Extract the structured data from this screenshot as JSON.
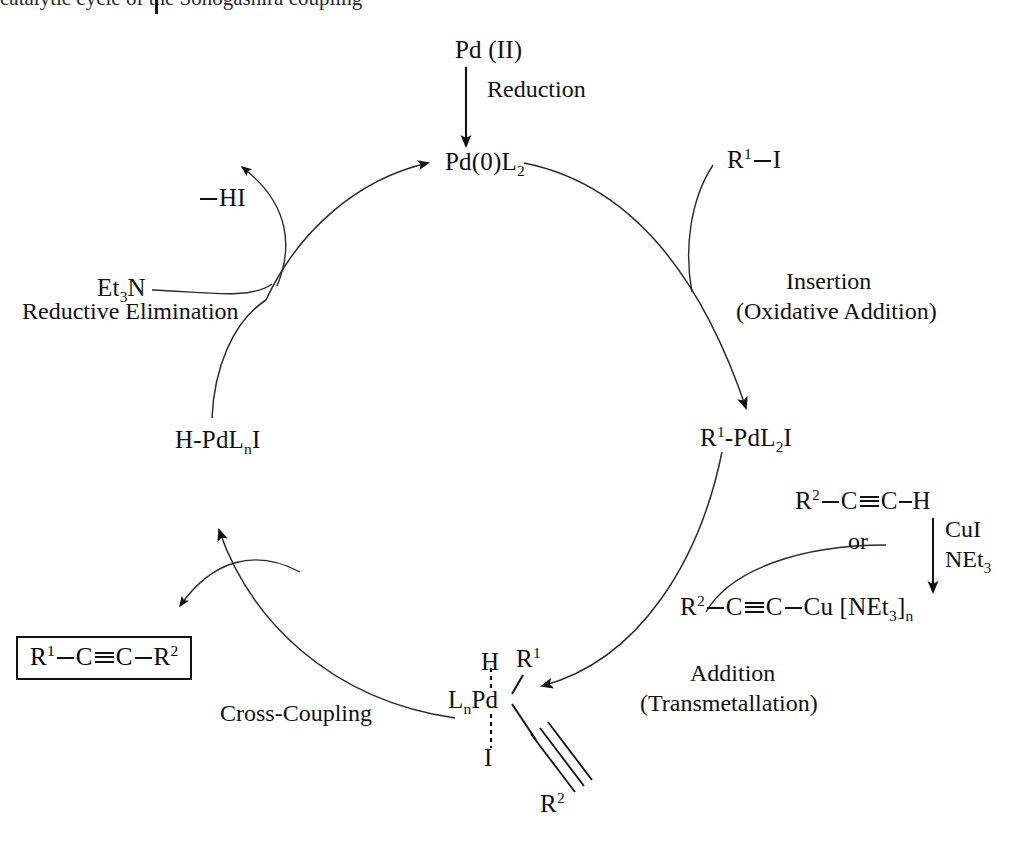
{
  "diagram": {
    "type": "catalytic-cycle",
    "background_color": "#ffffff",
    "line_color": "#111111"
  },
  "top_cut_text": "catalytic cycle of the Sonogashira coupling",
  "species": {
    "pd_two": "Pd (II)",
    "pd_zero": "Pd(0)L2",
    "pd_zero_html": "Pd(0)L<sub>2</sub>",
    "r1_iodide": "R1—I",
    "oxidative_adduct": "R1-PdL2I",
    "hydride_complex": "H-PdLnI",
    "hi": "— HI",
    "et3n": "Et3N",
    "alkyne": "R2—C≡C—H",
    "copper_acetylide": "R2—C≡C—Cu [NEt3]n",
    "product": "R1—C≡C—R2",
    "complex_center": "LnPd",
    "complex_top_left": "H",
    "complex_top_right": "R1",
    "complex_bottom": "I",
    "complex_alkynyl": "R2"
  },
  "steps": {
    "reduction": "Reduction",
    "insertion_line1": "Insertion",
    "insertion_line2": "(Oxidative Addition)",
    "addition_line1": "Addition",
    "addition_line2": "(Transmetallation)",
    "cross_coupling": "Cross-Coupling",
    "reductive_elimination": "Reductive Elimination"
  },
  "reagents": {
    "cui": "CuI",
    "net3": "NEt3",
    "or": "or"
  }
}
